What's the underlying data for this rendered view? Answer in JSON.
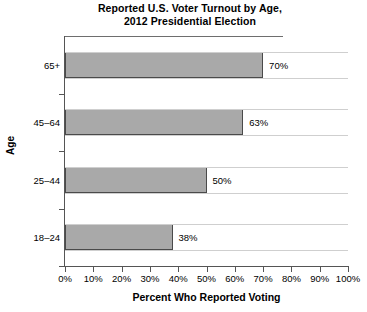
{
  "chart_data": {
    "type": "bar",
    "orientation": "horizontal",
    "title": "Reported U.S. Voter Turnout by Age, 2012 Presidential Election",
    "title_lines": [
      "Reported U.S. Voter Turnout by Age,",
      "2012 Presidential Election"
    ],
    "categories": [
      "65+",
      "45–64",
      "25–44",
      "18–24"
    ],
    "values": [
      70,
      63,
      50,
      38
    ],
    "value_labels": [
      "70%",
      "63%",
      "50%",
      "38%"
    ],
    "xlabel": "Percent Who Reported Voting",
    "ylabel": "Age",
    "xlim": [
      0,
      100
    ],
    "xticks": [
      0,
      10,
      20,
      30,
      40,
      50,
      60,
      70,
      80,
      90,
      100
    ],
    "xtick_labels": [
      "0%",
      "10%",
      "20%",
      "30%",
      "40%",
      "50%",
      "60%",
      "70%",
      "80%",
      "90%",
      "100%"
    ],
    "grid": false,
    "legend": null,
    "bar_color": "#a9a9a9",
    "bar_edge_color": "#4a4a4a",
    "axis_color": "#555555",
    "text_color": "#000000",
    "background": "#ffffff"
  }
}
